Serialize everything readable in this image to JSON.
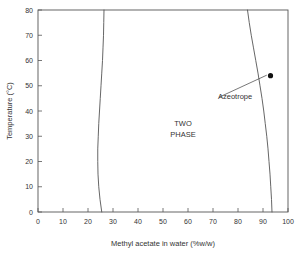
{
  "chart_data": {
    "type": "line",
    "title": "",
    "xlabel": "Methyl acetate in water (%w/w)",
    "ylabel": "Temperature (°C)",
    "xlim": [
      0,
      100
    ],
    "ylim": [
      0,
      80
    ],
    "xticks": [
      0,
      10,
      20,
      30,
      40,
      50,
      60,
      70,
      80,
      90,
      100
    ],
    "yticks": [
      0,
      10,
      20,
      30,
      40,
      50,
      60,
      70,
      80
    ],
    "xtick_labels": [
      "0",
      "10",
      "20",
      "30",
      "40",
      "50",
      "60",
      "70",
      "80",
      "90",
      "100"
    ],
    "ytick_labels": [
      "0",
      "10",
      "20",
      "30",
      "40",
      "50",
      "60",
      "70",
      "80"
    ],
    "grid": false,
    "legend": false,
    "series": [
      {
        "name": "water-rich solubility branch",
        "points": [
          [
            25.5,
            0
          ],
          [
            24.8,
            5
          ],
          [
            24.3,
            10
          ],
          [
            24.0,
            15
          ],
          [
            23.9,
            20
          ],
          [
            23.9,
            25
          ],
          [
            24.1,
            30
          ],
          [
            24.3,
            35
          ],
          [
            24.6,
            40
          ],
          [
            24.9,
            45
          ],
          [
            25.2,
            50
          ],
          [
            25.5,
            55
          ],
          [
            25.8,
            60
          ],
          [
            26.0,
            65
          ],
          [
            26.2,
            70
          ],
          [
            26.3,
            75
          ],
          [
            26.4,
            80
          ]
        ]
      },
      {
        "name": "ester-rich solubility branch",
        "points": [
          [
            93.6,
            0
          ],
          [
            93.4,
            5
          ],
          [
            93.1,
            10
          ],
          [
            92.8,
            15
          ],
          [
            92.4,
            20
          ],
          [
            92.0,
            25
          ],
          [
            91.5,
            30
          ],
          [
            90.9,
            35
          ],
          [
            90.3,
            40
          ],
          [
            89.6,
            45
          ],
          [
            88.8,
            50
          ],
          [
            88.0,
            55
          ],
          [
            87.1,
            60
          ],
          [
            86.2,
            65
          ],
          [
            85.3,
            70
          ],
          [
            84.5,
            75
          ],
          [
            83.8,
            80
          ]
        ]
      }
    ],
    "points": [
      {
        "name": "azeotrope",
        "x": 93,
        "y": 54,
        "marker": "filled-circle"
      }
    ],
    "annotations": [
      {
        "name": "azeotrope",
        "text": "Azeotrope",
        "text_x": 72,
        "text_y": 46,
        "leader_from_x": 72.5,
        "leader_from_y": 45.5,
        "leader_to_x": 91.5,
        "leader_to_y": 54.2
      },
      {
        "name": "two-phase-region",
        "line1": "TWO",
        "line2": "PHASE",
        "x": 58,
        "y": 34
      }
    ],
    "colors": {
      "curve": "#555555",
      "frame": "#555555",
      "text": "#333333",
      "marker": "#111111",
      "background": "#ffffff"
    }
  }
}
